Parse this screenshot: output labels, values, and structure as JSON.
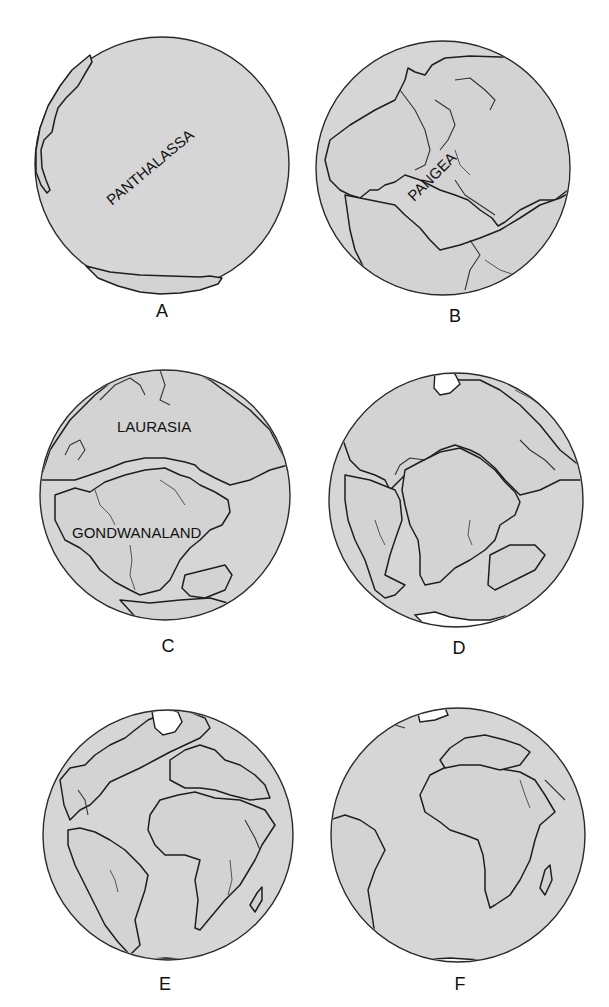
{
  "figure": {
    "colors": {
      "ocean_fill": "#d6d6d6",
      "outline": "#2a2a2a",
      "ice": "#ffffff",
      "background": "#ffffff"
    },
    "panels": [
      {
        "id": "A",
        "caption": "A",
        "labels": [
          "PANTHALASSA"
        ]
      },
      {
        "id": "B",
        "caption": "B",
        "labels": [
          "PANGEA"
        ]
      },
      {
        "id": "C",
        "caption": "C",
        "labels": [
          "LAURASIA",
          "GONDWANALAND"
        ]
      },
      {
        "id": "D",
        "caption": "D",
        "labels": []
      },
      {
        "id": "E",
        "caption": "E",
        "labels": []
      },
      {
        "id": "F",
        "caption": "F",
        "labels": []
      }
    ]
  }
}
